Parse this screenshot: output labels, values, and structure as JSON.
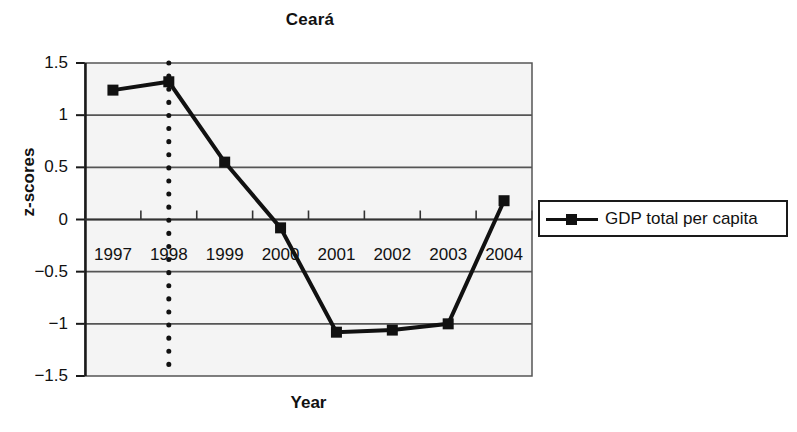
{
  "chart_data": {
    "type": "line",
    "title": "Ceará",
    "xlabel": "Year",
    "ylabel": "z-scores",
    "categories": [
      "1997",
      "1998",
      "1999",
      "2000",
      "2001",
      "2002",
      "2003",
      "2004"
    ],
    "series": [
      {
        "name": "GDP total per capita",
        "values": [
          1.24,
          1.32,
          0.55,
          -0.08,
          -1.08,
          -1.06,
          -1.0,
          0.18
        ]
      }
    ],
    "ylim": [
      -1.5,
      1.5
    ],
    "yticks": [
      "1.5",
      "1",
      "0.5",
      "0",
      "-0.5",
      "-1",
      "-1.5"
    ],
    "ytick_values": [
      1.5,
      1,
      0.5,
      0,
      -0.5,
      -1,
      -1.5
    ],
    "grid": true,
    "grid_axis": "y",
    "legend_position": "right",
    "annotations": [
      {
        "type": "vertical-dotted-line",
        "at_category": "1998",
        "label": ""
      }
    ],
    "colors": {
      "series": "#111111",
      "plot_background": "#f4f4f4",
      "gridline": "#555555",
      "axis": "#333333"
    }
  },
  "legend": {
    "entries": [
      {
        "label": "GDP total per capita",
        "marker": "square",
        "color": "#111111"
      }
    ]
  }
}
